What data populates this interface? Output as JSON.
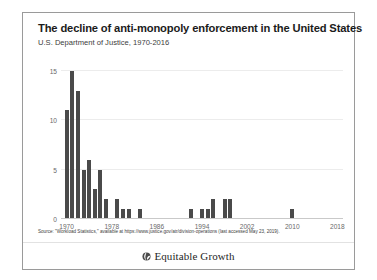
{
  "figure": {
    "title": "The decline of anti-monopoly enforcement in the United States",
    "subtitle": "U.S. Department of Justice, 1970-2016",
    "source_note": "Source: \"Workload Statistics,\" available at https://www.justice.gov/atr/division-operations (last accessed May 23, 2019).",
    "brand_name": "Equitable Growth",
    "brand_logo_icon": "equitable-growth-globe-icon",
    "border_color": "#9a9a9a",
    "background_color": "#ffffff"
  },
  "chart_data": {
    "type": "bar",
    "title": "The decline of anti-monopoly enforcement in the United States",
    "subtitle": "U.S. Department of Justice, 1970-2016",
    "xlabel": "",
    "ylabel": "",
    "xlim": [
      1969,
      2019
    ],
    "ylim": [
      0,
      16
    ],
    "xticks": [
      1970,
      1978,
      1986,
      1994,
      2002,
      2010,
      2018
    ],
    "xticklabels": [
      "1970",
      "1978",
      "1986",
      "1994",
      "2002",
      "2010",
      "2018"
    ],
    "yticks": [
      0,
      5,
      10,
      15
    ],
    "yticklabels": [
      "0",
      "5",
      "10",
      "15"
    ],
    "grid": "horizontal",
    "legend": "none",
    "bar_color": "#4a4a4a",
    "gridline_color": "#ececec",
    "axis_color": "#c9c9c9",
    "categories": [
      1970,
      1971,
      1972,
      1973,
      1974,
      1975,
      1976,
      1977,
      1978,
      1979,
      1980,
      1981,
      1982,
      1983,
      1984,
      1985,
      1986,
      1987,
      1988,
      1989,
      1990,
      1991,
      1992,
      1993,
      1994,
      1995,
      1996,
      1997,
      1998,
      1999,
      2000,
      2001,
      2002,
      2003,
      2004,
      2005,
      2006,
      2007,
      2008,
      2009,
      2010,
      2011,
      2012,
      2013,
      2014,
      2015,
      2016
    ],
    "values": [
      11,
      15,
      13,
      5,
      6,
      3,
      5,
      2,
      0,
      2,
      1,
      1,
      0,
      1,
      0,
      0,
      0,
      0,
      0,
      0,
      0,
      0,
      1,
      0,
      1,
      1,
      2,
      0,
      2,
      2,
      0,
      0,
      0,
      0,
      0,
      0,
      0,
      0,
      0,
      0,
      1,
      0,
      0,
      0,
      0,
      0,
      0
    ]
  }
}
